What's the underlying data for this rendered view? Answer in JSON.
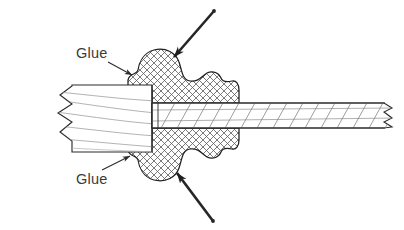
{
  "figure": {
    "background_color": "#ffffff",
    "line_color": "#2b2b2b",
    "text_color": "#3a3a3a",
    "hatch_color": "#555555",
    "fiber_color": "#6b6b6b",
    "width": 404,
    "height": 230
  },
  "labels": {
    "glue_top": "Glue",
    "glue_bottom": "Glue"
  },
  "callouts": [
    {
      "name": "glue-top-leader",
      "from": [
        108,
        62
      ],
      "to": [
        133,
        75
      ]
    },
    {
      "name": "glue-bottom-leader",
      "from": [
        105,
        168
      ],
      "to": [
        131,
        155
      ]
    },
    {
      "name": "top-pointer-leader",
      "from": [
        213,
        10
      ],
      "to": [
        172,
        57
      ]
    },
    {
      "name": "bottom-pointer-leader",
      "from": [
        212,
        222
      ],
      "to": [
        175,
        172
      ]
    }
  ],
  "parts": {
    "tube": {
      "name": "hollow-tube",
      "left_break": true,
      "x_left": 18,
      "x_right": 152,
      "y_top": 85,
      "y_bottom": 152,
      "grain_lines": 6
    },
    "glue_joint": {
      "name": "glue-fillet",
      "hatch_pattern": "cross-hatch",
      "x_start": 128,
      "x_end": 238,
      "y_top": 48,
      "y_bottom": 185
    },
    "rod": {
      "name": "solid-rod",
      "right_break": true,
      "x_left": 152,
      "x_right": 396,
      "y_top": 103,
      "y_bottom": 128,
      "fiber_lines": 18
    }
  }
}
